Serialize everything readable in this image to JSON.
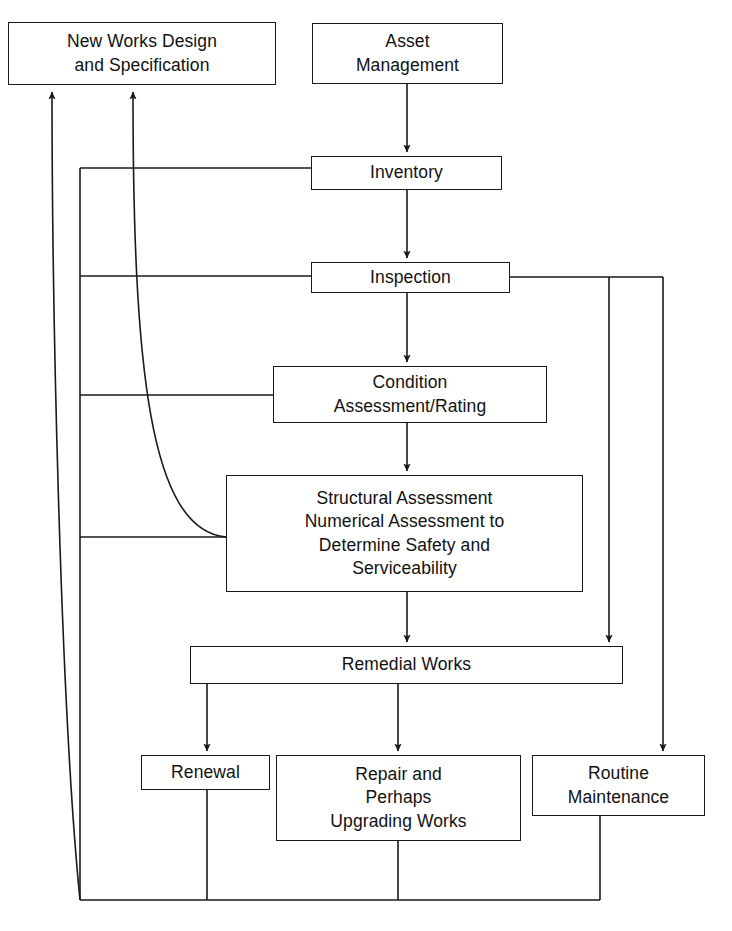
{
  "diagram": {
    "canvas": {
      "width": 732,
      "height": 931
    },
    "style": {
      "line_color": "#1a1a1a",
      "box_fill": "#ffffff",
      "text_color": "#111111",
      "line_width": 1.6
    },
    "nodes": [
      {
        "id": "new_works",
        "label": "New Works Design\nand Specification",
        "x": 8,
        "y": 22,
        "w": 268,
        "h": 63
      },
      {
        "id": "asset_management",
        "label": "Asset\nManagement",
        "x": 312,
        "y": 23,
        "w": 191,
        "h": 61
      },
      {
        "id": "inventory",
        "label": "Inventory",
        "x": 311,
        "y": 156,
        "w": 191,
        "h": 34
      },
      {
        "id": "inspection",
        "label": "Inspection",
        "x": 311,
        "y": 262,
        "w": 199,
        "h": 31
      },
      {
        "id": "condition_assessment",
        "label": "Condition\nAssessment/Rating",
        "x": 273,
        "y": 366,
        "w": 274,
        "h": 57
      },
      {
        "id": "structural_assessment",
        "label": "Structural Assessment\nNumerical Assessment to\nDetermine Safety and\nServiceability",
        "x": 226,
        "y": 475,
        "w": 357,
        "h": 117
      },
      {
        "id": "remedial_works",
        "label": "Remedial Works",
        "x": 190,
        "y": 646,
        "w": 433,
        "h": 38
      },
      {
        "id": "renewal",
        "label": "Renewal",
        "x": 141,
        "y": 755,
        "w": 129,
        "h": 35
      },
      {
        "id": "repair",
        "label": "Repair and\nPerhaps\nUpgrading Works",
        "x": 276,
        "y": 755,
        "w": 245,
        "h": 86
      },
      {
        "id": "routine_maintenance",
        "label": "Routine\nMaintenance",
        "x": 532,
        "y": 755,
        "w": 173,
        "h": 61
      }
    ],
    "edges": [
      {
        "id": "asset-to-inventory",
        "from": "asset_management",
        "to": "inventory",
        "arrow": true
      },
      {
        "id": "inventory-to-inspection",
        "from": "inventory",
        "to": "inspection",
        "arrow": true
      },
      {
        "id": "inspection-to-condition",
        "from": "inspection",
        "to": "condition_assessment",
        "arrow": true
      },
      {
        "id": "condition-to-structural",
        "from": "condition_assessment",
        "to": "structural_assessment",
        "arrow": true
      },
      {
        "id": "structural-to-remedial",
        "from": "structural_assessment",
        "to": "remedial_works",
        "arrow": true
      },
      {
        "id": "remedial-to-renewal",
        "from": "remedial_works",
        "to": "renewal",
        "arrow": true
      },
      {
        "id": "remedial-to-repair",
        "from": "remedial_works",
        "to": "repair",
        "arrow": true
      },
      {
        "id": "inspection-to-remedial",
        "from": "inspection",
        "to": "remedial_works",
        "arrow": true
      },
      {
        "id": "inspection-to-routine",
        "from": "inspection",
        "to": "routine_maintenance",
        "arrow": true
      },
      {
        "id": "inventory-feedback-left",
        "from": "inventory",
        "to": "new_works",
        "arrow": true
      },
      {
        "id": "inspection-feedback-left",
        "from": "inspection",
        "to": "new_works",
        "arrow": true
      },
      {
        "id": "condition-feedback-left",
        "from": "condition_assessment",
        "to": "new_works",
        "arrow": true
      },
      {
        "id": "structural-feedback-left",
        "from": "structural_assessment",
        "to": "new_works",
        "arrow": true
      },
      {
        "id": "renewal-feedback-bottom",
        "from": "renewal",
        "to": "new_works",
        "arrow": true
      },
      {
        "id": "repair-feedback-bottom",
        "from": "repair",
        "to": "new_works",
        "arrow": true
      },
      {
        "id": "routine-feedback-bottom",
        "from": "routine_maintenance",
        "to": "new_works",
        "arrow": true
      }
    ]
  }
}
